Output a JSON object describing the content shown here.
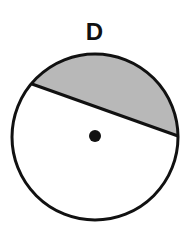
{
  "figure": {
    "label": "D",
    "circle": {
      "cx": 95,
      "cy": 137,
      "r": 83,
      "stroke": "#111111",
      "fill": "#ffffff"
    },
    "chord": {
      "x1": 32,
      "y1": 84,
      "x2": 178,
      "y2": 136
    },
    "shaded_region": {
      "type": "minor segment above chord",
      "fill": "#b8b8b8"
    },
    "center_dot": {
      "cx": 95,
      "cy": 136,
      "r": 6,
      "fill": "#111111"
    }
  }
}
